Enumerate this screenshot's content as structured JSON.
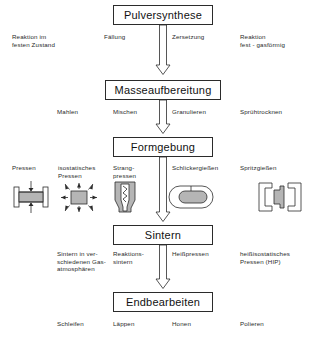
{
  "diagram": {
    "title_text": "Prozesskette Keramikherstellung",
    "language": "de",
    "colors": {
      "line": "#2b2b2b",
      "box_fill": "#ffffff",
      "icon_fill": "#b5b5b5",
      "text": "#1a1a1a"
    },
    "stages": [
      {
        "id": "pulversynthese",
        "label": "Pulversynthese"
      },
      {
        "id": "masseaufbereitung",
        "label": "Masseaufbereitung"
      },
      {
        "id": "formgebung",
        "label": "Formgebung"
      },
      {
        "id": "sintern",
        "label": "Sintern"
      },
      {
        "id": "endbearbeiten",
        "label": "Endbearbeiten"
      }
    ],
    "arrows": [
      {
        "id": "arrow-1",
        "from": "pulversynthese",
        "to": "masseaufbereitung"
      },
      {
        "id": "arrow-2",
        "from": "masseaufbereitung",
        "to": "formgebung"
      },
      {
        "id": "arrow-3",
        "from": "formgebung",
        "to": "sintern"
      },
      {
        "id": "arrow-4",
        "from": "sintern",
        "to": "endbearbeiten"
      }
    ],
    "row1_labels": {
      "far_left": "Reaktion im\nfesten Zustand",
      "left": "Fällung",
      "right": "Zersetzung",
      "far_right": "Reaktion\nfest - gasförmig"
    },
    "row2_labels": {
      "far_left": "Mahlen",
      "left": "Mischen",
      "right": "Granulieren",
      "far_right": "Sprühtrocknen"
    },
    "row3_labels": {
      "far_left": "Pressen",
      "left": "isostatisches\nPressen",
      "mid": "Strang-\npressen",
      "right": "Schlickergießen",
      "far_right": "Spritzgießen"
    },
    "row3_icons": [
      {
        "id": "pressen-icon",
        "name": "uniaxial-pressing-icon"
      },
      {
        "id": "isostatisches-icon",
        "name": "isostatic-pressing-icon"
      },
      {
        "id": "strangpressen-icon",
        "name": "extrusion-icon"
      },
      {
        "id": "schlickergiessen-icon",
        "name": "slip-casting-icon"
      },
      {
        "id": "spritzgiessen-icon",
        "name": "injection-molding-icon"
      }
    ],
    "row4_labels": {
      "far_left": "Sintern in ver-\nschiedenen Gas-\natmosphären",
      "left": "Reaktions-\nsintern",
      "right": "Heißpressen",
      "far_right": "heißisostatisches\nPressen (HIP)"
    },
    "row5_labels": {
      "far_left": "Schleifen",
      "left": "Läppen",
      "right": "Honen",
      "far_right": "Polieren"
    }
  }
}
